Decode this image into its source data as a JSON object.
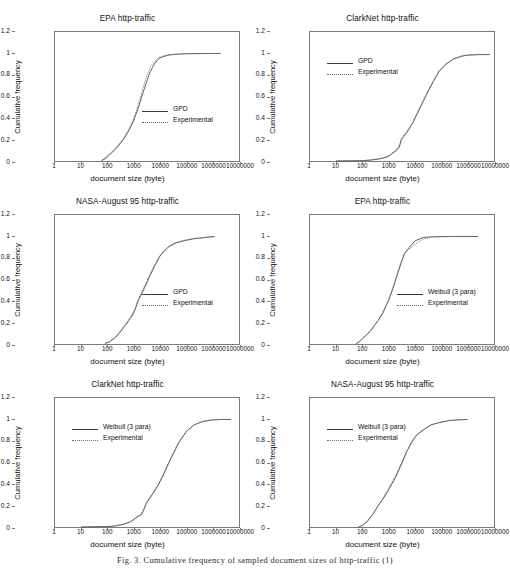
{
  "figure": {
    "caption": "Fig. 3.  Cumulative frequency of sampled document sizes of http-traffic (1)",
    "axis_label_x": "document size (byte)",
    "axis_label_y": "Cumulative frequency",
    "y_ticks": [
      "0",
      "0.2",
      "0.4",
      "0.6",
      "0.8",
      "1",
      "1.2"
    ],
    "x_ticks": [
      "1",
      "10",
      "100",
      "1000",
      "10000",
      "100000",
      "1000000",
      "10000000"
    ],
    "colors": {
      "model_line": "#3a3a3a",
      "experimental_line": "#6a6a6a",
      "axis": "#7a7a7a",
      "text": "#111111",
      "background": "#ffffff"
    }
  },
  "chart_data": [
    {
      "id": "epa-gpd",
      "type": "line",
      "title": "EPA http-traffic",
      "xlabel": "document size (byte)",
      "ylabel": "Cumulative frequency",
      "xscale": "log",
      "xlim": [
        1,
        10000000
      ],
      "ylim": [
        0,
        1.2
      ],
      "xticks": [
        1,
        10,
        100,
        1000,
        10000,
        100000,
        1000000,
        10000000
      ],
      "yticks": [
        0,
        0.2,
        0.4,
        0.6,
        0.8,
        1,
        1.2
      ],
      "grid": false,
      "legend_position": "center-right",
      "legend": [
        "GPD",
        "Experimental"
      ],
      "series": [
        {
          "name": "GPD",
          "style": "solid",
          "x": [
            60,
            80,
            100,
            150,
            200,
            300,
            400,
            600,
            800,
            1000,
            1500,
            2000,
            3000,
            4000,
            6000,
            8000,
            10000,
            20000,
            40000,
            100000,
            300000,
            1000000,
            2000000
          ],
          "y": [
            0.005,
            0.02,
            0.04,
            0.08,
            0.11,
            0.16,
            0.2,
            0.27,
            0.33,
            0.38,
            0.5,
            0.6,
            0.73,
            0.82,
            0.9,
            0.94,
            0.96,
            0.985,
            0.993,
            0.998,
            0.999,
            1.0,
            1.0
          ]
        },
        {
          "name": "Experimental",
          "style": "dotted",
          "x": [
            60,
            80,
            100,
            150,
            200,
            300,
            400,
            600,
            800,
            1000,
            1500,
            2000,
            3000,
            4000,
            6000,
            8000,
            10000,
            20000,
            40000,
            100000,
            300000,
            1000000,
            2000000
          ],
          "y": [
            0.004,
            0.03,
            0.055,
            0.09,
            0.12,
            0.17,
            0.21,
            0.28,
            0.34,
            0.4,
            0.53,
            0.64,
            0.78,
            0.86,
            0.92,
            0.955,
            0.97,
            0.988,
            0.994,
            0.998,
            1.0,
            1.0,
            1.0
          ]
        }
      ]
    },
    {
      "id": "clarknet-gpd",
      "type": "line",
      "title": "ClarkNet http-traffic",
      "xlabel": "document size (byte)",
      "ylabel": "Cumulative frequency",
      "xscale": "log",
      "xlim": [
        1,
        10000000
      ],
      "ylim": [
        0,
        1.2
      ],
      "xticks": [
        1,
        10,
        100,
        1000,
        10000,
        100000,
        1000000,
        10000000
      ],
      "yticks": [
        0,
        0.2,
        0.4,
        0.6,
        0.8,
        1,
        1.2
      ],
      "grid": false,
      "legend_position": "upper-left",
      "legend": [
        "GPD",
        "Experimental"
      ],
      "series": [
        {
          "name": "GPD",
          "style": "solid",
          "x": [
            10,
            100,
            200,
            400,
            700,
            1000,
            2000,
            2500,
            3000,
            5000,
            8000,
            12000,
            20000,
            30000,
            50000,
            80000,
            150000,
            300000,
            600000,
            1000000,
            3000000,
            7000000
          ],
          "y": [
            0.0,
            0.003,
            0.008,
            0.018,
            0.03,
            0.045,
            0.1,
            0.13,
            0.2,
            0.27,
            0.35,
            0.44,
            0.55,
            0.64,
            0.74,
            0.83,
            0.9,
            0.95,
            0.975,
            0.985,
            0.99,
            0.99
          ]
        },
        {
          "name": "Experimental",
          "style": "dotted",
          "x": [
            10,
            100,
            200,
            400,
            700,
            1000,
            2000,
            2500,
            3000,
            5000,
            8000,
            12000,
            20000,
            30000,
            50000,
            80000,
            150000,
            300000,
            600000,
            1000000,
            3000000,
            7000000
          ],
          "y": [
            0.0,
            0.004,
            0.01,
            0.02,
            0.033,
            0.05,
            0.11,
            0.145,
            0.21,
            0.28,
            0.36,
            0.45,
            0.56,
            0.65,
            0.75,
            0.84,
            0.905,
            0.955,
            0.978,
            0.987,
            0.99,
            0.99
          ]
        }
      ]
    },
    {
      "id": "nasa-gpd",
      "type": "line",
      "title": "NASA-August 95 http-traffic",
      "xlabel": "document size (byte)",
      "ylabel": "Cumulative frequency",
      "xscale": "log",
      "xlim": [
        1,
        10000000
      ],
      "ylim": [
        0,
        1.2
      ],
      "xticks": [
        1,
        10,
        100,
        1000,
        10000,
        100000,
        1000000,
        10000000
      ],
      "yticks": [
        0,
        0.2,
        0.4,
        0.6,
        0.8,
        1,
        1.2
      ],
      "grid": false,
      "legend_position": "center-right",
      "legend": [
        "GPD",
        "Experimental"
      ],
      "series": [
        {
          "name": "GPD",
          "style": "solid",
          "x": [
            80,
            120,
            200,
            300,
            500,
            700,
            900,
            1200,
            1500,
            2000,
            3000,
            4000,
            6000,
            10000,
            20000,
            40000,
            80000,
            200000,
            500000,
            1200000
          ],
          "y": [
            0.005,
            0.02,
            0.06,
            0.11,
            0.18,
            0.23,
            0.27,
            0.34,
            0.41,
            0.47,
            0.56,
            0.63,
            0.72,
            0.82,
            0.9,
            0.94,
            0.96,
            0.98,
            0.99,
            1.0
          ]
        },
        {
          "name": "Experimental",
          "style": "dotted",
          "x": [
            80,
            120,
            200,
            300,
            500,
            700,
            900,
            1200,
            1500,
            2000,
            3000,
            4000,
            6000,
            10000,
            20000,
            40000,
            80000,
            200000,
            500000,
            1200000
          ],
          "y": [
            0.006,
            0.025,
            0.065,
            0.12,
            0.19,
            0.245,
            0.285,
            0.355,
            0.425,
            0.485,
            0.575,
            0.645,
            0.73,
            0.83,
            0.905,
            0.945,
            0.965,
            0.982,
            0.992,
            1.0
          ]
        }
      ]
    },
    {
      "id": "epa-weibull",
      "type": "line",
      "title": "EPA http-traffic",
      "xlabel": "document size (byte)",
      "ylabel": "Cumulative frequency",
      "xscale": "log",
      "xlim": [
        1,
        10000000
      ],
      "ylim": [
        0,
        1.2
      ],
      "xticks": [
        1,
        10,
        100,
        1000,
        10000,
        100000,
        1000000,
        10000000
      ],
      "yticks": [
        0,
        0.2,
        0.4,
        0.6,
        0.8,
        1,
        1.2
      ],
      "grid": false,
      "legend_position": "center-right",
      "legend": [
        "Weibull (3 para)",
        "Experimental"
      ],
      "series": [
        {
          "name": "Weibull (3 para)",
          "style": "solid",
          "x": [
            55,
            80,
            100,
            150,
            200,
            300,
            400,
            600,
            800,
            1000,
            1500,
            2000,
            3000,
            4000,
            6000,
            10000,
            20000,
            50000,
            200000,
            1000000,
            2500000
          ],
          "y": [
            0.0,
            0.025,
            0.05,
            0.09,
            0.12,
            0.18,
            0.22,
            0.29,
            0.36,
            0.41,
            0.53,
            0.63,
            0.76,
            0.84,
            0.9,
            0.96,
            0.99,
            0.998,
            1.0,
            1.0,
            1.0
          ]
        },
        {
          "name": "Experimental",
          "style": "dotted",
          "x": [
            55,
            80,
            100,
            150,
            200,
            300,
            400,
            600,
            800,
            1000,
            1500,
            2000,
            3000,
            4000,
            6000,
            10000,
            20000,
            50000,
            200000,
            1000000,
            2500000
          ],
          "y": [
            0.0,
            0.028,
            0.055,
            0.095,
            0.125,
            0.185,
            0.225,
            0.3,
            0.365,
            0.42,
            0.545,
            0.64,
            0.775,
            0.855,
            0.885,
            0.93,
            0.975,
            0.995,
            1.0,
            1.0,
            1.0
          ]
        }
      ]
    },
    {
      "id": "clarknet-weibull",
      "type": "line",
      "title": "ClarkNet http-traffic",
      "xlabel": "document size (byte)",
      "ylabel": "Cumulative frequency",
      "xscale": "log",
      "xlim": [
        1,
        10000000
      ],
      "ylim": [
        0,
        1.2
      ],
      "xticks": [
        1,
        10,
        100,
        1000,
        10000,
        100000,
        1000000,
        10000000
      ],
      "yticks": [
        0,
        0.2,
        0.4,
        0.6,
        0.8,
        1,
        1.2
      ],
      "grid": false,
      "legend_position": "upper-left",
      "legend": [
        "Weibull (3 para)",
        "Experimental"
      ],
      "series": [
        {
          "name": "Weibull (3 para)",
          "style": "solid",
          "x": [
            10,
            100,
            200,
            400,
            700,
            1000,
            1500,
            2000,
            2500,
            3000,
            5000,
            8000,
            12000,
            20000,
            30000,
            50000,
            100000,
            200000,
            400000,
            900000,
            2000000,
            5000000
          ],
          "y": [
            0.0,
            0.004,
            0.01,
            0.025,
            0.045,
            0.07,
            0.1,
            0.12,
            0.17,
            0.22,
            0.3,
            0.38,
            0.46,
            0.58,
            0.67,
            0.78,
            0.89,
            0.95,
            0.98,
            0.995,
            1.0,
            1.0
          ]
        },
        {
          "name": "Experimental",
          "style": "dotted",
          "x": [
            10,
            100,
            200,
            400,
            700,
            1000,
            1500,
            2000,
            2500,
            3000,
            5000,
            8000,
            12000,
            20000,
            30000,
            50000,
            100000,
            200000,
            400000,
            900000,
            2000000,
            5000000
          ],
          "y": [
            0.0,
            0.005,
            0.012,
            0.027,
            0.048,
            0.075,
            0.105,
            0.13,
            0.18,
            0.23,
            0.31,
            0.39,
            0.47,
            0.59,
            0.68,
            0.785,
            0.892,
            0.952,
            0.982,
            0.996,
            1.0,
            1.0
          ]
        }
      ]
    },
    {
      "id": "nasa-weibull",
      "type": "line",
      "title": "NASA-August 95 http-traffic",
      "xlabel": "document size (byte)",
      "ylabel": "Cumulative frequency",
      "xscale": "log",
      "xlim": [
        1,
        10000000
      ],
      "ylim": [
        0,
        1.2
      ],
      "xticks": [
        1,
        10,
        100,
        1000,
        10000,
        100000,
        1000000,
        10000000
      ],
      "yticks": [
        0,
        0.2,
        0.4,
        0.6,
        0.8,
        1,
        1.2
      ],
      "grid": false,
      "legend_position": "upper-left",
      "legend": [
        "Weibull (3 para)",
        "Experimental"
      ],
      "series": [
        {
          "name": "Weibull (3 para)",
          "style": "solid",
          "x": [
            70,
            100,
            150,
            250,
            400,
            600,
            900,
            1300,
            1800,
            2500,
            3500,
            5000,
            8000,
            12000,
            20000,
            40000,
            80000,
            200000,
            500000,
            1000000
          ],
          "y": [
            0.0,
            0.015,
            0.05,
            0.12,
            0.2,
            0.26,
            0.33,
            0.4,
            0.46,
            0.54,
            0.62,
            0.71,
            0.8,
            0.86,
            0.9,
            0.95,
            0.97,
            0.99,
            0.998,
            1.0
          ]
        },
        {
          "name": "Experimental",
          "style": "dotted",
          "x": [
            70,
            100,
            150,
            250,
            400,
            600,
            900,
            1300,
            1800,
            2500,
            3500,
            5000,
            8000,
            12000,
            20000,
            40000,
            80000,
            200000,
            500000,
            1000000
          ],
          "y": [
            0.0,
            0.018,
            0.055,
            0.125,
            0.205,
            0.27,
            0.345,
            0.415,
            0.475,
            0.555,
            0.635,
            0.72,
            0.81,
            0.865,
            0.905,
            0.952,
            0.972,
            0.991,
            0.998,
            1.0
          ]
        }
      ]
    }
  ]
}
